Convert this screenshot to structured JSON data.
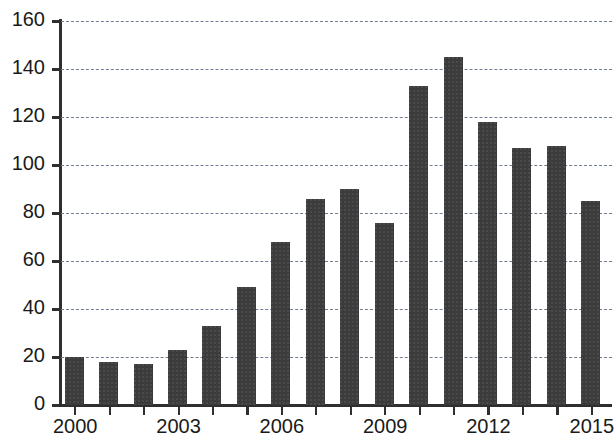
{
  "chart_data": {
    "type": "bar",
    "title": "",
    "subtitle": "",
    "xlabel": "",
    "ylabel": "",
    "categories": [
      2000,
      2001,
      2002,
      2003,
      2004,
      2005,
      2006,
      2007,
      2008,
      2009,
      2010,
      2011,
      2012,
      2013,
      2014,
      2015
    ],
    "values": [
      20,
      18,
      17,
      23,
      33,
      49,
      68,
      86,
      90,
      76,
      133,
      145,
      118,
      107,
      108,
      85
    ],
    "series": [
      {
        "name": "",
        "values": [
          20,
          18,
          17,
          23,
          33,
          49,
          68,
          86,
          90,
          76,
          133,
          145,
          118,
          107,
          108,
          85
        ]
      }
    ],
    "ylim": [
      0,
      160
    ],
    "xlim": [
      1999.3,
      2015.7
    ],
    "y_ticks": [
      0,
      20,
      40,
      60,
      80,
      100,
      120,
      140,
      160
    ],
    "y_tick_labels": [
      "0",
      "20",
      "40",
      "60",
      "80",
      "100",
      "120",
      "140",
      "160"
    ],
    "x_ticks": [
      2000,
      2001,
      2002,
      2003,
      2004,
      2005,
      2006,
      2007,
      2008,
      2009,
      2010,
      2011,
      2012,
      2013,
      2014,
      2015
    ],
    "x_tick_labels_shown": [
      "2000",
      "2003",
      "2006",
      "2009",
      "2012",
      "2015"
    ],
    "x_labeled_ticks": [
      2000,
      2003,
      2006,
      2009,
      2012,
      2015
    ],
    "grid": true,
    "grid_axis": "y",
    "grid_style": "dashed",
    "legend": false,
    "legend_position": "none",
    "annotations": [],
    "colors": {
      "bar": "#3c3c3c",
      "grid": "#6f7d92",
      "axis": "#2f2f2f",
      "text": "#1a1a1a",
      "background": "#ffffff"
    }
  }
}
